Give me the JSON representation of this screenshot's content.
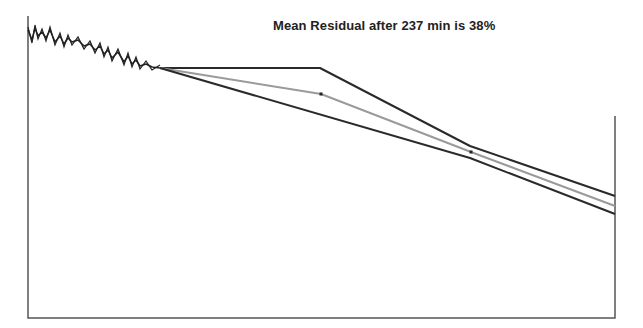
{
  "chart_data": {
    "type": "line",
    "title": "Mean Residual after 237 min is 38%",
    "xlabel": "",
    "ylabel": "",
    "grid": false,
    "legend": null,
    "frame": {
      "left": 28,
      "top": 16,
      "right": 615,
      "bottom": 318
    },
    "observed_noisy_series": {
      "name": "observed",
      "color": "#222222",
      "points": [
        [
          28,
          30
        ],
        [
          32,
          40
        ],
        [
          35,
          28
        ],
        [
          38,
          36
        ],
        [
          42,
          32
        ],
        [
          46,
          38
        ],
        [
          50,
          30
        ],
        [
          55,
          42
        ],
        [
          60,
          36
        ],
        [
          64,
          44
        ],
        [
          68,
          38
        ],
        [
          72,
          42
        ],
        [
          78,
          40
        ],
        [
          84,
          46
        ],
        [
          90,
          44
        ],
        [
          95,
          50
        ],
        [
          100,
          46
        ],
        [
          104,
          54
        ],
        [
          108,
          50
        ],
        [
          112,
          58
        ],
        [
          118,
          52
        ],
        [
          124,
          62
        ],
        [
          128,
          56
        ],
        [
          132,
          64
        ],
        [
          136,
          60
        ],
        [
          140,
          66
        ],
        [
          146,
          64
        ],
        [
          152,
          67
        ],
        [
          160,
          68
        ]
      ]
    },
    "series": [
      {
        "name": "upper-bound",
        "color": "#2a2a2a",
        "width": 2,
        "points": [
          [
            160,
            68
          ],
          [
            320,
            68
          ],
          [
            470,
            146
          ],
          [
            615,
            196
          ]
        ]
      },
      {
        "name": "mean-forecast",
        "color": "#9a9a9a",
        "width": 2,
        "points": [
          [
            160,
            68
          ],
          [
            321,
            94
          ],
          [
            471,
            152
          ],
          [
            615,
            206
          ]
        ],
        "markers": [
          [
            321,
            94
          ],
          [
            471,
            152
          ]
        ]
      },
      {
        "name": "lower-bound",
        "color": "#2a2a2a",
        "width": 2,
        "points": [
          [
            160,
            68
          ],
          [
            470,
            158
          ],
          [
            615,
            214
          ]
        ]
      }
    ],
    "annotation": {
      "text": "Mean Residual after 237 min is 38%",
      "minutes": 237,
      "residual_percent": 38
    }
  }
}
